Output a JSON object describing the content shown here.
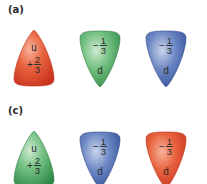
{
  "panels": [
    {
      "label": "(a)",
      "quarks": [
        {
          "flavor": "u",
          "sign": "+",
          "numerator": "2",
          "denominator": "3",
          "color": "red",
          "fill": "#e04a2f",
          "shape": "up"
        },
        {
          "flavor": "d",
          "sign": "−",
          "numerator": "1",
          "denominator": "3",
          "color": "green",
          "fill": "#4fae63",
          "shape": "down"
        },
        {
          "flavor": "d",
          "sign": "−",
          "numerator": "1",
          "denominator": "3",
          "color": "blue",
          "fill": "#4a6fb5",
          "shape": "down"
        }
      ]
    },
    {
      "label": "(c)",
      "quarks": [
        {
          "flavor": "u",
          "sign": "+",
          "numerator": "2",
          "denominator": "3",
          "color": "green",
          "fill": "#4fae63",
          "shape": "up"
        },
        {
          "flavor": "d",
          "sign": "−",
          "numerator": "1",
          "denominator": "3",
          "color": "blue",
          "fill": "#4a6fb5",
          "shape": "down"
        },
        {
          "flavor": "d",
          "sign": "−",
          "numerator": "1",
          "denominator": "3",
          "color": "red",
          "fill": "#e04a2f",
          "shape": "down"
        }
      ]
    }
  ]
}
